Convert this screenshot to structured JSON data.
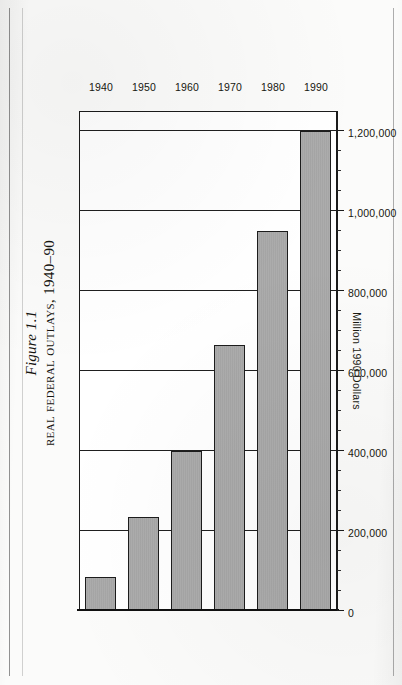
{
  "figure": {
    "number": "Figure 1.1",
    "title_prefix": "R",
    "title": "eal ",
    "title_full": "Real Federal Outlays, 1940–90"
  },
  "chart_data": {
    "type": "bar",
    "orientation": "horizontal-on-rotated-page",
    "title": "Real Federal Outlays, 1940–90",
    "figure_number": "Figure 1.1",
    "categories": [
      "1940",
      "1950",
      "1960",
      "1970",
      "1980",
      "1990"
    ],
    "values": [
      85000,
      235000,
      400000,
      665000,
      950000,
      1200000
    ],
    "xlabel": "",
    "ylabel": "Million 1990 Dollars",
    "ylim": [
      0,
      1250000
    ],
    "ytick_labels": [
      "0",
      "200,000",
      "400,000",
      "600,000",
      "800,000",
      "1,000,000",
      "1,200,000"
    ],
    "ytick_values": [
      0,
      200000,
      400000,
      600000,
      800000,
      1000000,
      1200000
    ],
    "minor_tick_interval": 50000,
    "grid": true,
    "legend": "none",
    "bar_fill_color": "#a8a8a8",
    "bar_edge_color": "#1c1c1c",
    "axis_color": "#1b1b1b"
  },
  "page": {
    "folio": ""
  }
}
